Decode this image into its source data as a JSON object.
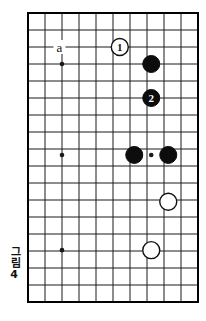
{
  "figure": {
    "caption_word": "그림",
    "caption_number": "4",
    "type": "go-board-diagram"
  },
  "board": {
    "origin_x": 28,
    "origin_y": 13,
    "spacing": 17.0,
    "cols": 10,
    "rows": 17,
    "line_color": "#1a1a1a",
    "border_color": "#000000",
    "background": "#ffffff",
    "line_width": 1,
    "border_width": 2
  },
  "star_points": [
    {
      "name": "star-point-upper-left",
      "col": 2,
      "row": 3
    },
    {
      "name": "star-point-middle-left",
      "col": 2,
      "row": 8.35
    },
    {
      "name": "star-point-lower-left",
      "col": 2,
      "row": 13.95
    },
    {
      "name": "star-point-middle-center",
      "col": 7.25,
      "row": 8.35
    }
  ],
  "stones": [
    {
      "name": "white-stone-move-1",
      "color": "white",
      "label": "1",
      "col": 5.4,
      "row": 2.0,
      "radius": 8.5
    },
    {
      "name": "black-stone-plain-upper",
      "color": "black",
      "label": "",
      "col": 7.25,
      "row": 3.0,
      "radius": 8.5
    },
    {
      "name": "black-stone-move-2",
      "color": "black",
      "label": "2",
      "col": 7.25,
      "row": 5.0,
      "radius": 8.5
    },
    {
      "name": "black-stone-center-left",
      "color": "black",
      "label": "",
      "col": 6.25,
      "row": 8.35,
      "radius": 8.5
    },
    {
      "name": "black-stone-center-right",
      "color": "black",
      "label": "",
      "col": 8.25,
      "row": 8.35,
      "radius": 8.5
    },
    {
      "name": "white-stone-lower-right",
      "color": "white",
      "label": "",
      "col": 8.25,
      "row": 11.1,
      "radius": 8.5
    },
    {
      "name": "white-stone-lower-center",
      "color": "white",
      "label": "",
      "col": 7.25,
      "row": 13.95,
      "radius": 8.5
    }
  ],
  "markers": [
    {
      "name": "point-label-a",
      "text": "a",
      "col": 1.85,
      "row": 2.0
    }
  ],
  "colors": {
    "black_stone": "#0d0d0d",
    "white_stone_fill": "#ffffff",
    "white_stone_stroke": "#111111",
    "grid": "#1a1a1a",
    "text": "#111111"
  }
}
